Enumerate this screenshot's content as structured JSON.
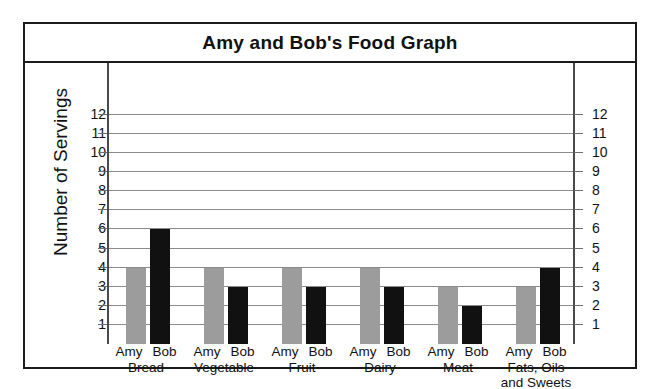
{
  "chart_data": {
    "type": "bar",
    "title": "Amy and Bob's Food Graph",
    "xlabel": "",
    "ylabel": "Number of Servings",
    "ylim": [
      0,
      12
    ],
    "ytick_labels": [
      "12",
      "11",
      "10",
      "9",
      "8",
      "7",
      "6",
      "5",
      "4",
      "3",
      "2",
      "1"
    ],
    "yticks": [
      12,
      11,
      10,
      9,
      8,
      7,
      6,
      5,
      4,
      3,
      2,
      1
    ],
    "grid": true,
    "legend": "none",
    "dual_axis": true,
    "right_axis_labels": [
      "12",
      "11",
      "10",
      "9",
      "8",
      "7",
      "6",
      "5",
      "4",
      "3",
      "2",
      "1"
    ],
    "categories": [
      "Bread",
      "Vegetable",
      "Fruit",
      "Dairy",
      "Meat",
      "Fats, Oils\nand Sweets"
    ],
    "series": [
      {
        "name": "Amy",
        "color": "#9c9c9c",
        "values": [
          4,
          4,
          4,
          4,
          3,
          3
        ]
      },
      {
        "name": "Bob",
        "color": "#111111",
        "values": [
          6,
          3,
          3,
          3,
          2,
          4
        ]
      }
    ]
  },
  "colors": {
    "amy_bar": "#9c9c9c",
    "bob_bar": "#111111",
    "frame": "#1b1b1b",
    "gridline": "#8b8b8b",
    "text": "#111111",
    "background": "#ffffff"
  }
}
